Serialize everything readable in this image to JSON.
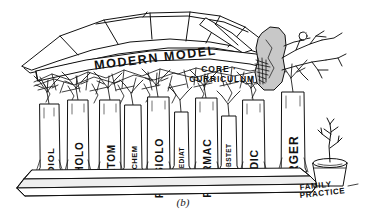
{
  "figure": {
    "caption": "(b)",
    "title_band": "MODERN MODEL",
    "canopy_label_line1": "CORE ·",
    "canopy_label_line2": "CURRICULUM",
    "outsider_label_line1": "FAMILY",
    "outsider_label_line2": "PRACTICE",
    "colors": {
      "ink": "#111111",
      "paper": "#ffffff",
      "blob_fill": "#c8c8c8",
      "column_fill": "#ffffff",
      "base_shade": "#efefef"
    },
    "columns": [
      {
        "label": "RADIOL",
        "x": 40,
        "w": 19,
        "top": 104,
        "bottom": 172,
        "size": "large"
      },
      {
        "label": "PATHOLO",
        "x": 68,
        "w": 20,
        "top": 100,
        "bottom": 174,
        "size": "large"
      },
      {
        "label": "ANATOM",
        "x": 100,
        "w": 20,
        "top": 100,
        "bottom": 175,
        "size": "large"
      },
      {
        "label": "BIOCHEM",
        "x": 125,
        "w": 16,
        "top": 105,
        "bottom": 172,
        "size": "small"
      },
      {
        "label": "PHYSIOLO",
        "x": 148,
        "w": 21,
        "top": 97,
        "bottom": 176,
        "size": "large"
      },
      {
        "label": "PEDIAT",
        "x": 175,
        "w": 13,
        "top": 112,
        "bottom": 170,
        "size": "small"
      },
      {
        "label": "PHARMAC",
        "x": 196,
        "w": 21,
        "top": 98,
        "bottom": 176,
        "size": "large"
      },
      {
        "label": "OBSTET",
        "x": 222,
        "w": 14,
        "top": 116,
        "bottom": 170,
        "size": "small"
      },
      {
        "label": "MEDIC",
        "x": 243,
        "w": 21,
        "top": 100,
        "bottom": 175,
        "size": "large"
      },
      {
        "label": "SURGER",
        "x": 282,
        "w": 22,
        "top": 92,
        "bottom": 172,
        "size": "large"
      }
    ]
  }
}
